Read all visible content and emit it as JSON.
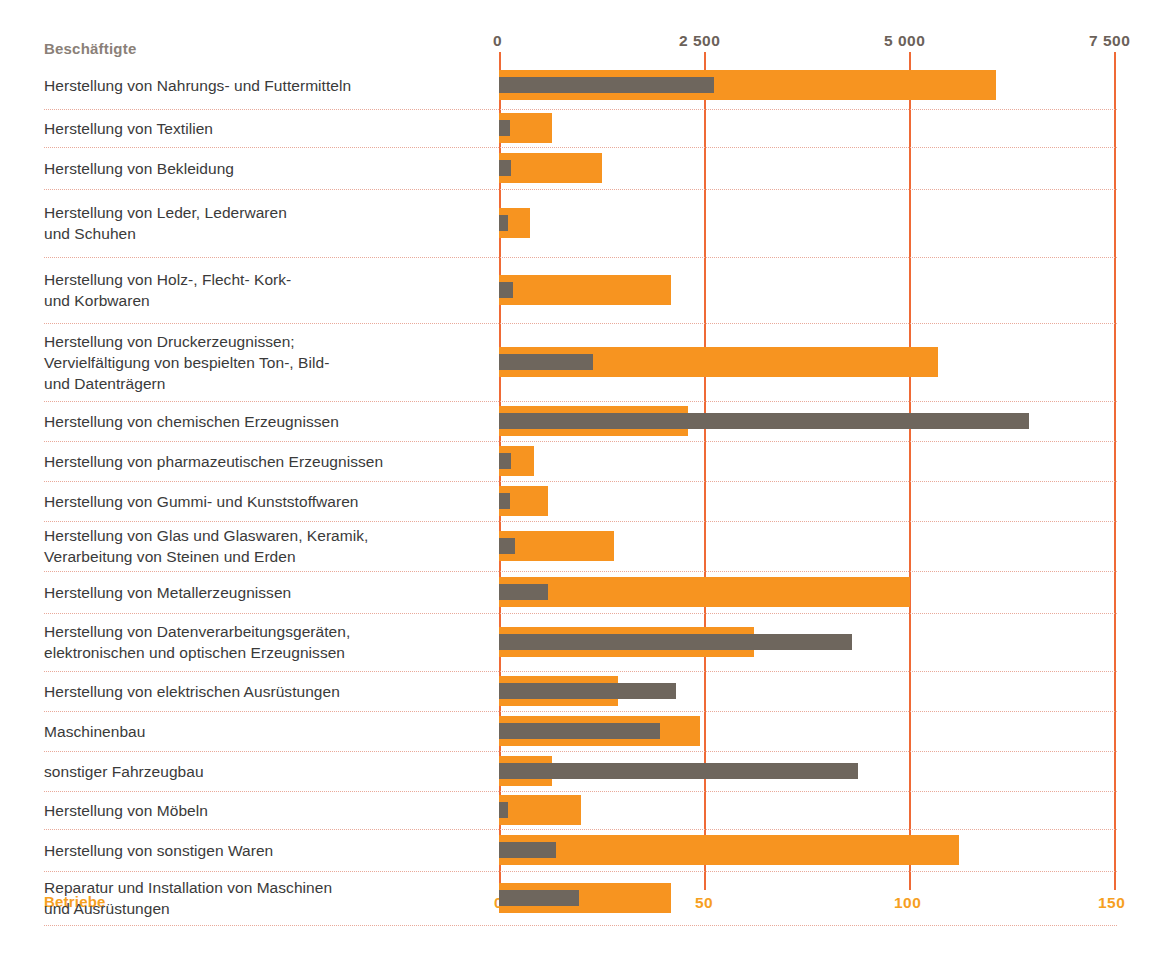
{
  "legend": {
    "employees_label": "Beschäftigte",
    "establishments_label": "Betriebe",
    "employees_color": "#6e665d",
    "establishments_color": "#f79420"
  },
  "axes": {
    "top_ticks": [
      "0",
      "2 500",
      "5 000",
      "7 500"
    ],
    "bottom_ticks": [
      "0",
      "50",
      "100",
      "150"
    ],
    "top_color": "#6b6159",
    "bottom_color": "#f6a01f",
    "gridline_color": "#ef6a36"
  },
  "chart_data": {
    "type": "bar",
    "orientation": "horizontal",
    "grid": true,
    "legend_position": "axis-titles",
    "xlabel": "",
    "ylabel": "",
    "categories": [
      "Herstellung von Nahrungs- und Futtermitteln",
      "Herstellung von Textilien",
      "Herstellung von Bekleidung",
      "Herstellung von Leder, Lederwaren\nund Schuhen",
      "Herstellung von Holz-, Flecht- Kork-\nund Korbwaren",
      "Herstellung von Druckerzeugnissen;\nVervielfältigung von bespielten Ton-, Bild-\nund Datenträgern",
      "Herstellung von chemischen Erzeugnissen",
      "Herstellung von pharmazeutischen Erzeugnissen",
      "Herstellung von Gummi- und Kunststoffwaren",
      "Herstellung von Glas und Glaswaren, Keramik,\nVerarbeitung von Steinen und Erden",
      "Herstellung von Metallerzeugnissen",
      "Herstellung von Datenverarbeitungsgeräten,\nelektronischen und optischen Erzeugnissen",
      "Herstellung von elektrischen Ausrüstungen",
      "Maschinenbau",
      "sonstiger Fahrzeugbau",
      "Herstellung von Möbeln",
      "Herstellung von sonstigen Waren",
      "Reparatur und Installation von Maschinen\nund Ausrüstungen"
    ],
    "series": [
      {
        "name": "Beschäftigte",
        "color": "#6e665d",
        "axis": "top",
        "axis_max": 7500,
        "values": [
          2620,
          140,
          150,
          110,
          170,
          1150,
          6450,
          150,
          130,
          200,
          600,
          4300,
          2160,
          1960,
          4370,
          110,
          700,
          980
        ]
      },
      {
        "name": "Betriebe",
        "color": "#f79420",
        "axis": "bottom",
        "axis_max": 150,
        "values": [
          121,
          13,
          25,
          7.5,
          42,
          107,
          46,
          8.5,
          12,
          28,
          100,
          62,
          29,
          49,
          13,
          20,
          112,
          42
        ]
      }
    ],
    "top_axis_range": [
      0,
      7500
    ],
    "bottom_axis_range": [
      0,
      150
    ]
  },
  "rows": [
    {
      "label": "Herstellung von Nahrungs- und Futtermitteln",
      "employees": 2620,
      "establishments": 121
    },
    {
      "label": "Herstellung von Textilien",
      "employees": 140,
      "establishments": 13
    },
    {
      "label": "Herstellung von Bekleidung",
      "employees": 150,
      "establishments": 25
    },
    {
      "label": "Herstellung von Leder, Lederwaren und Schuhen",
      "employees": 110,
      "establishments": 7.5
    },
    {
      "label": "Herstellung von Holz-, Flecht- Kork- und Korbwaren",
      "employees": 170,
      "establishments": 42
    },
    {
      "label": "Herstellung von Druckerzeugnissen; Vervielfältigung von bespielten Ton-, Bild- und Datenträgern",
      "employees": 1150,
      "establishments": 107
    },
    {
      "label": "Herstellung von chemischen Erzeugnissen",
      "employees": 6450,
      "establishments": 46
    },
    {
      "label": "Herstellung von pharmazeutischen Erzeugnissen",
      "employees": 150,
      "establishments": 8.5
    },
    {
      "label": "Herstellung von Gummi- und Kunststoffwaren",
      "employees": 130,
      "establishments": 12
    },
    {
      "label": "Herstellung von Glas und Glaswaren, Keramik, Verarbeitung von Steinen und Erden",
      "employees": 200,
      "establishments": 28
    },
    {
      "label": "Herstellung von Metallerzeugnissen",
      "employees": 600,
      "establishments": 100
    },
    {
      "label": "Herstellung von Datenverarbeitungsgeräten, elektronischen und optischen Erzeugnissen",
      "employees": 4300,
      "establishments": 62
    },
    {
      "label": "Herstellung von elektrischen Ausrüstungen",
      "employees": 2160,
      "establishments": 29
    },
    {
      "label": "Maschinenbau",
      "employees": 1960,
      "establishments": 49
    },
    {
      "label": "sonstiger Fahrzeugbau",
      "employees": 4370,
      "establishments": 13
    },
    {
      "label": "Herstellung von Möbeln",
      "employees": 110,
      "establishments": 20
    },
    {
      "label": "Herstellung von sonstigen Waren",
      "employees": 700,
      "establishments": 112
    },
    {
      "label": "Reparatur und Installation von Maschinen und Ausrüstungen",
      "employees": 980,
      "establishments": 42
    }
  ],
  "row_label_lines": [
    [
      "Herstellung von Nahrungs- und Futtermitteln"
    ],
    [
      "Herstellung von Textilien"
    ],
    [
      "Herstellung von Bekleidung"
    ],
    [
      "Herstellung von Leder, Lederwaren",
      "und Schuhen"
    ],
    [
      "Herstellung von Holz-, Flecht- Kork-",
      "und Korbwaren"
    ],
    [
      "Herstellung von Druckerzeugnissen;",
      "Vervielfältigung von bespielten Ton-, Bild-",
      "und Datenträgern"
    ],
    [
      "Herstellung von chemischen Erzeugnissen"
    ],
    [
      "Herstellung von pharmazeutischen Erzeugnissen"
    ],
    [
      "Herstellung von Gummi- und Kunststoffwaren"
    ],
    [
      "Herstellung von Glas und Glaswaren, Keramik,",
      "Verarbeitung von Steinen und Erden"
    ],
    [
      "Herstellung von Metallerzeugnissen"
    ],
    [
      "Herstellung von Datenverarbeitungsgeräten,",
      "elektronischen und optischen Erzeugnissen"
    ],
    [
      "Herstellung von elektrischen Ausrüstungen"
    ],
    [
      "Maschinenbau"
    ],
    [
      "sonstiger Fahrzeugbau"
    ],
    [
      "Herstellung von Möbeln"
    ],
    [
      "Herstellung von sonstigen Waren"
    ],
    [
      "Reparatur und Installation von Maschinen",
      "und Ausrüstungen"
    ]
  ]
}
